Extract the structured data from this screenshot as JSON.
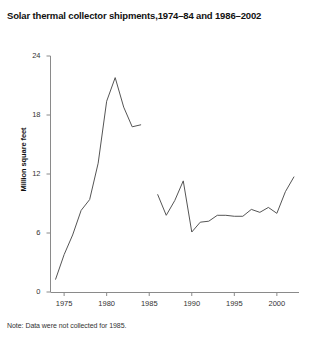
{
  "chart_data": {
    "type": "line",
    "title": "Solar thermal collector shipments,1974–84 and 1986–2002",
    "xlabel": "",
    "ylabel": "Million square feet",
    "xlim": [
      1973.4,
      2002.6
    ],
    "ylim": [
      0,
      24
    ],
    "yticks": [
      0,
      6,
      12,
      18,
      24
    ],
    "ytick_labels": [
      "0",
      "6",
      "12",
      "18",
      "24"
    ],
    "xticks": [
      1975,
      1980,
      1985,
      1990,
      1995,
      2000
    ],
    "xtick_labels": [
      "1975",
      "1980",
      "1985",
      "1990",
      "1995",
      "2000"
    ],
    "grid": false,
    "legend": false,
    "line_color": "#555555",
    "note": "Note: Data were not collected for 1985.",
    "series": [
      {
        "name": "1974–84",
        "x": [
          1974,
          1975,
          1976,
          1977,
          1978,
          1979,
          1980,
          1981,
          1982,
          1983,
          1984
        ],
        "values": [
          1.3,
          3.8,
          5.8,
          8.3,
          9.4,
          13.1,
          19.4,
          21.8,
          18.8,
          16.8,
          17.0
        ]
      },
      {
        "name": "1986–2002",
        "x": [
          1986,
          1987,
          1988,
          1989,
          1990,
          1991,
          1992,
          1993,
          1994,
          1995,
          1996,
          1997,
          1998,
          1999,
          2000,
          2001,
          2002
        ],
        "values": [
          9.9,
          7.8,
          9.3,
          11.3,
          6.1,
          7.1,
          7.2,
          7.8,
          7.8,
          7.7,
          7.7,
          8.4,
          8.1,
          8.6,
          8.0,
          10.2,
          11.7
        ]
      }
    ]
  }
}
